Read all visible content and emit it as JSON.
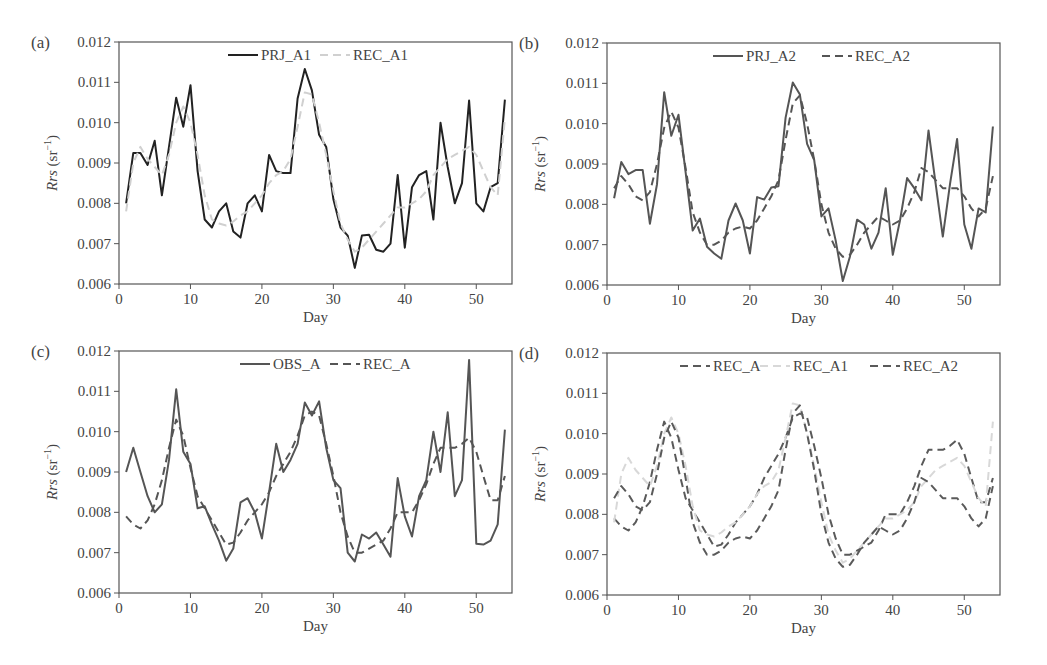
{
  "figure": {
    "panels": [
      "(a)",
      "(b)",
      "(c)",
      "(d)"
    ]
  },
  "chart_data": [
    {
      "panel": "(a)",
      "type": "line",
      "title": "",
      "xlabel": "Day",
      "ylabel": "Rrs (sr⁻¹)",
      "xlim": [
        0,
        55
      ],
      "ylim": [
        0.006,
        0.012
      ],
      "xticks": [
        0,
        10,
        20,
        30,
        40,
        50
      ],
      "yticks": [
        "0.006",
        "0.007",
        "0.008",
        "0.009",
        "0.010",
        "0.011",
        "0.012"
      ],
      "grid": false,
      "legend": {
        "position": "top-center",
        "entries": [
          "PRJ_A1",
          "REC_A1"
        ]
      },
      "x": [
        1,
        2,
        3,
        4,
        5,
        6,
        7,
        8,
        9,
        10,
        11,
        12,
        13,
        14,
        15,
        16,
        17,
        18,
        19,
        20,
        21,
        22,
        23,
        24,
        25,
        26,
        27,
        28,
        29,
        30,
        31,
        32,
        33,
        34,
        35,
        36,
        37,
        38,
        39,
        40,
        41,
        42,
        43,
        44,
        45,
        46,
        47,
        48,
        49,
        50,
        51,
        52,
        53,
        54
      ],
      "series": [
        {
          "name": "PRJ_A1",
          "style": "solid",
          "color": "#222222",
          "values": [
            0.008,
            0.00925,
            0.00925,
            0.00895,
            0.00955,
            0.0082,
            0.0094,
            0.01062,
            0.0099,
            0.01093,
            0.0088,
            0.0076,
            0.0074,
            0.0078,
            0.008,
            0.0073,
            0.00715,
            0.008,
            0.0082,
            0.0078,
            0.0092,
            0.0088,
            0.00875,
            0.00875,
            0.0106,
            0.01133,
            0.0108,
            0.0097,
            0.0094,
            0.0081,
            0.0074,
            0.0072,
            0.0064,
            0.0072,
            0.00722,
            0.00685,
            0.0068,
            0.007,
            0.0087,
            0.0069,
            0.0084,
            0.0087,
            0.0088,
            0.0076,
            0.01,
            0.0089,
            0.008,
            0.0085,
            0.01055,
            0.008,
            0.0078,
            0.0084,
            0.0085,
            0.01057
          ]
        },
        {
          "name": "REC_A1",
          "style": "dashed",
          "color": "#d0d0d0",
          "values": [
            0.0078,
            0.009,
            0.0094,
            0.0091,
            0.0089,
            0.0087,
            0.0092,
            0.01,
            0.0104,
            0.01,
            0.0092,
            0.0082,
            0.0076,
            0.0075,
            0.00745,
            0.00755,
            0.0077,
            0.0078,
            0.008,
            0.0082,
            0.0085,
            0.0087,
            0.0088,
            0.0091,
            0.0099,
            0.01075,
            0.0107,
            0.01,
            0.0092,
            0.0083,
            0.0075,
            0.0071,
            0.0068,
            0.0069,
            0.0071,
            0.0073,
            0.0075,
            0.0077,
            0.0079,
            0.0079,
            0.008,
            0.0081,
            0.0083,
            0.0087,
            0.0089,
            0.0091,
            0.0092,
            0.0093,
            0.0094,
            0.0092,
            0.0088,
            0.0084,
            0.0082,
            0.0101
          ]
        }
      ]
    },
    {
      "panel": "(b)",
      "type": "line",
      "title": "",
      "xlabel": "Day",
      "ylabel": "Rrs (sr⁻¹)",
      "xlim": [
        0,
        55
      ],
      "ylim": [
        0.006,
        0.012
      ],
      "xticks": [
        0,
        10,
        20,
        30,
        40,
        50
      ],
      "yticks": [
        "0.006",
        "0.007",
        "0.008",
        "0.009",
        "0.010",
        "0.011",
        "0.012"
      ],
      "grid": false,
      "legend": {
        "position": "top-center",
        "entries": [
          "PRJ_A2",
          "REC_A2"
        ]
      },
      "x": [
        1,
        2,
        3,
        4,
        5,
        6,
        7,
        8,
        9,
        10,
        11,
        12,
        13,
        14,
        15,
        16,
        17,
        18,
        19,
        20,
        21,
        22,
        23,
        24,
        25,
        26,
        27,
        28,
        29,
        30,
        31,
        32,
        33,
        34,
        35,
        36,
        37,
        38,
        39,
        40,
        41,
        42,
        43,
        44,
        45,
        46,
        47,
        48,
        49,
        50,
        51,
        52,
        53,
        54
      ],
      "series": [
        {
          "name": "PRJ_A2",
          "style": "solid",
          "color": "#555555",
          "values": [
            0.00815,
            0.00905,
            0.00875,
            0.00885,
            0.00885,
            0.00752,
            0.0085,
            0.01078,
            0.0097,
            0.01022,
            0.0088,
            0.00735,
            0.00765,
            0.00695,
            0.00678,
            0.00665,
            0.0076,
            0.00802,
            0.0076,
            0.00678,
            0.00818,
            0.00812,
            0.00842,
            0.00845,
            0.01015,
            0.01102,
            0.01072,
            0.0095,
            0.0091,
            0.0077,
            0.0079,
            0.0071,
            0.0061,
            0.0067,
            0.00762,
            0.0075,
            0.0069,
            0.0073,
            0.0084,
            0.00675,
            0.0076,
            0.00865,
            0.0084,
            0.0081,
            0.00983,
            0.0085,
            0.0072,
            0.0085,
            0.00962,
            0.0075,
            0.0069,
            0.0079,
            0.0078,
            0.00993
          ]
        },
        {
          "name": "REC_A2",
          "style": "dashed",
          "color": "#555555",
          "values": [
            0.0084,
            0.0087,
            0.0085,
            0.0082,
            0.0081,
            0.0083,
            0.009,
            0.0099,
            0.0103,
            0.0099,
            0.0089,
            0.0078,
            0.0073,
            0.007,
            0.007,
            0.0071,
            0.0073,
            0.0074,
            0.00745,
            0.0074,
            0.0076,
            0.0079,
            0.0082,
            0.0086,
            0.0096,
            0.0105,
            0.0107,
            0.01,
            0.0091,
            0.008,
            0.0073,
            0.0069,
            0.0067,
            0.00675,
            0.007,
            0.0073,
            0.0075,
            0.0077,
            0.0076,
            0.0075,
            0.0076,
            0.0079,
            0.0083,
            0.0089,
            0.0088,
            0.0086,
            0.0084,
            0.0084,
            0.0084,
            0.0082,
            0.0079,
            0.0077,
            0.0079,
            0.0087
          ]
        }
      ]
    },
    {
      "panel": "(c)",
      "type": "line",
      "title": "",
      "xlabel": "Day",
      "ylabel": "Rrs (sr⁻¹)",
      "xlim": [
        0,
        55
      ],
      "ylim": [
        0.006,
        0.012
      ],
      "xticks": [
        0,
        10,
        20,
        30,
        40,
        50
      ],
      "yticks": [
        "0.006",
        "0.007",
        "0.008",
        "0.009",
        "0.010",
        "0.011",
        "0.012"
      ],
      "grid": false,
      "legend": {
        "position": "top-center",
        "entries": [
          "OBS_A",
          "REC_A"
        ]
      },
      "x": [
        1,
        2,
        3,
        4,
        5,
        6,
        7,
        8,
        9,
        10,
        11,
        12,
        13,
        14,
        15,
        16,
        17,
        18,
        19,
        20,
        21,
        22,
        23,
        24,
        25,
        26,
        27,
        28,
        29,
        30,
        31,
        32,
        33,
        34,
        35,
        36,
        37,
        38,
        39,
        40,
        41,
        42,
        43,
        44,
        45,
        46,
        47,
        48,
        49,
        50,
        51,
        52,
        53,
        54
      ],
      "series": [
        {
          "name": "OBS_A",
          "style": "solid",
          "color": "#555555",
          "values": [
            0.009,
            0.0096,
            0.009,
            0.0084,
            0.008,
            0.0082,
            0.0093,
            0.01105,
            0.0095,
            0.0092,
            0.0081,
            0.00815,
            0.0077,
            0.0073,
            0.0068,
            0.0071,
            0.00825,
            0.00835,
            0.008,
            0.00735,
            0.0085,
            0.0097,
            0.009,
            0.0093,
            0.0097,
            0.01072,
            0.0104,
            0.01075,
            0.0096,
            0.0088,
            0.0086,
            0.007,
            0.00678,
            0.00745,
            0.00735,
            0.0075,
            0.0072,
            0.0069,
            0.00885,
            0.0079,
            0.0074,
            0.0084,
            0.0088,
            0.01,
            0.009,
            0.01048,
            0.0084,
            0.0088,
            0.01178,
            0.00722,
            0.0072,
            0.0073,
            0.0077,
            0.01005
          ]
        },
        {
          "name": "REC_A",
          "style": "dashed",
          "color": "#555555",
          "values": [
            0.0079,
            0.0077,
            0.0076,
            0.0078,
            0.0082,
            0.0088,
            0.0096,
            0.0103,
            0.0099,
            0.0091,
            0.0084,
            0.0081,
            0.0078,
            0.0075,
            0.0072,
            0.00725,
            0.0075,
            0.0078,
            0.008,
            0.0082,
            0.0085,
            0.0089,
            0.0092,
            0.0095,
            0.0099,
            0.0104,
            0.0105,
            0.0104,
            0.0097,
            0.0089,
            0.008,
            0.0074,
            0.007,
            0.007,
            0.0071,
            0.0072,
            0.0073,
            0.0076,
            0.008,
            0.008,
            0.008,
            0.0083,
            0.0087,
            0.0092,
            0.0096,
            0.0096,
            0.0096,
            0.0097,
            0.00985,
            0.0095,
            0.0089,
            0.0083,
            0.0083,
            0.0089
          ]
        }
      ]
    },
    {
      "panel": "(d)",
      "type": "line",
      "title": "",
      "xlabel": "Day",
      "ylabel": "Rrs (sr⁻¹)",
      "xlim": [
        0,
        55
      ],
      "ylim": [
        0.006,
        0.012
      ],
      "xticks": [
        0,
        10,
        20,
        30,
        40,
        50
      ],
      "yticks": [
        "0.006",
        "0.007",
        "0.008",
        "0.009",
        "0.010",
        "0.011",
        "0.012"
      ],
      "grid": false,
      "legend": {
        "position": "top-center",
        "entries": [
          "REC_A",
          "REC_A1",
          "REC_A2"
        ]
      },
      "x": [
        1,
        2,
        3,
        4,
        5,
        6,
        7,
        8,
        9,
        10,
        11,
        12,
        13,
        14,
        15,
        16,
        17,
        18,
        19,
        20,
        21,
        22,
        23,
        24,
        25,
        26,
        27,
        28,
        29,
        30,
        31,
        32,
        33,
        34,
        35,
        36,
        37,
        38,
        39,
        40,
        41,
        42,
        43,
        44,
        45,
        46,
        47,
        48,
        49,
        50,
        51,
        52,
        53,
        54
      ],
      "series": [
        {
          "name": "REC_A",
          "style": "dashed",
          "color": "#5a5a5a",
          "values": [
            0.0079,
            0.0077,
            0.0076,
            0.0078,
            0.0082,
            0.0088,
            0.0096,
            0.0103,
            0.0099,
            0.0091,
            0.0084,
            0.0081,
            0.0078,
            0.0075,
            0.0072,
            0.00725,
            0.0075,
            0.0078,
            0.008,
            0.0082,
            0.0085,
            0.0089,
            0.0092,
            0.0095,
            0.0099,
            0.0104,
            0.0105,
            0.0104,
            0.0097,
            0.0089,
            0.008,
            0.0074,
            0.007,
            0.007,
            0.0071,
            0.0072,
            0.0073,
            0.0076,
            0.008,
            0.008,
            0.008,
            0.0083,
            0.0087,
            0.0092,
            0.0096,
            0.0096,
            0.0096,
            0.0097,
            0.00985,
            0.0095,
            0.0089,
            0.0083,
            0.0083,
            0.0089
          ]
        },
        {
          "name": "REC_A1",
          "style": "dashed",
          "color": "#d8d8d8",
          "values": [
            0.0078,
            0.009,
            0.0094,
            0.0091,
            0.0089,
            0.0087,
            0.0092,
            0.01,
            0.0104,
            0.01,
            0.0092,
            0.0082,
            0.0076,
            0.0075,
            0.00745,
            0.00755,
            0.0077,
            0.0078,
            0.008,
            0.0082,
            0.0085,
            0.0087,
            0.0088,
            0.0091,
            0.0099,
            0.01075,
            0.0107,
            0.01,
            0.0092,
            0.0083,
            0.0075,
            0.0071,
            0.0068,
            0.0069,
            0.0071,
            0.0073,
            0.0075,
            0.0077,
            0.0079,
            0.0079,
            0.008,
            0.0081,
            0.0083,
            0.0087,
            0.0089,
            0.0091,
            0.0092,
            0.0093,
            0.0094,
            0.0092,
            0.0088,
            0.0084,
            0.0082,
            0.0103
          ]
        },
        {
          "name": "REC_A2",
          "style": "dashed",
          "color": "#5a5a5a",
          "values": [
            0.0084,
            0.0087,
            0.0085,
            0.0082,
            0.0081,
            0.0083,
            0.009,
            0.0099,
            0.0103,
            0.0099,
            0.0089,
            0.0078,
            0.0073,
            0.007,
            0.007,
            0.0071,
            0.0073,
            0.0074,
            0.00745,
            0.0074,
            0.0076,
            0.0079,
            0.0082,
            0.0086,
            0.0096,
            0.0105,
            0.0107,
            0.01,
            0.0091,
            0.008,
            0.0073,
            0.0069,
            0.0067,
            0.00675,
            0.007,
            0.0073,
            0.0075,
            0.0077,
            0.0076,
            0.0075,
            0.0076,
            0.0079,
            0.0083,
            0.0089,
            0.0088,
            0.0086,
            0.0084,
            0.0084,
            0.0084,
            0.0082,
            0.0079,
            0.0077,
            0.0079,
            0.0087
          ]
        }
      ]
    }
  ]
}
